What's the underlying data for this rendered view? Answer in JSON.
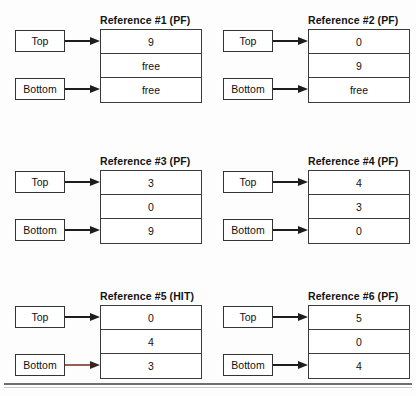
{
  "diagram": {
    "kind": "stack-reference-trace",
    "cell_free_label": "free",
    "pointer_labels": {
      "top": "Top",
      "bottom": "Bottom"
    },
    "accent_arrow_color": "#9e5b52",
    "border_color": "#3b3b3b",
    "panels": [
      {
        "title": "Reference #1 (PF)",
        "status": "PF",
        "cells": [
          "9",
          "free",
          "free"
        ],
        "top_points_to": 0,
        "bottom_points_to": 2,
        "bottom_arrow_accent": false
      },
      {
        "title": "Reference #2 (PF)",
        "status": "PF",
        "cells": [
          "0",
          "9",
          "free"
        ],
        "top_points_to": 0,
        "bottom_points_to": 2,
        "bottom_arrow_accent": false
      },
      {
        "title": "Reference #3 (PF)",
        "status": "PF",
        "cells": [
          "3",
          "0",
          "9"
        ],
        "top_points_to": 0,
        "bottom_points_to": 2,
        "bottom_arrow_accent": false
      },
      {
        "title": "Reference #4 (PF)",
        "status": "PF",
        "cells": [
          "4",
          "3",
          "0"
        ],
        "top_points_to": 0,
        "bottom_points_to": 2,
        "bottom_arrow_accent": false
      },
      {
        "title": "Reference #5 (HIT)",
        "status": "HIT",
        "cells": [
          "0",
          "4",
          "3"
        ],
        "top_points_to": 0,
        "bottom_points_to": 2,
        "bottom_arrow_accent": true
      },
      {
        "title": "Reference #6 (PF)",
        "status": "PF",
        "cells": [
          "5",
          "0",
          "4"
        ],
        "top_points_to": 0,
        "bottom_points_to": 2,
        "bottom_arrow_accent": false
      }
    ]
  }
}
